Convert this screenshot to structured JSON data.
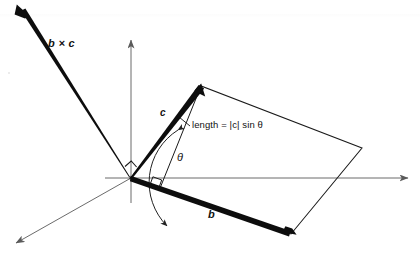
{
  "figure": {
    "width": 420,
    "height": 261,
    "background_color": "#ffffff",
    "stroke_color": "#111111",
    "axis_color": "#5a5a5a"
  },
  "labels": {
    "cross_product": "b × c",
    "vector_c": "c",
    "vector_b": "b",
    "theta": "θ",
    "length_annotation": "length = |c| sin θ"
  },
  "geometry": {
    "origin": {
      "x": 131,
      "y": 178
    },
    "vectors": [
      {
        "name": "b-cross-c",
        "label": "b × c",
        "from": {
          "x": 131,
          "y": 178
        },
        "to": {
          "x": 17,
          "y": 5
        },
        "style": "thick-arrow"
      },
      {
        "name": "c",
        "label": "c",
        "from": {
          "x": 131,
          "y": 178
        },
        "to": {
          "x": 201,
          "y": 86
        },
        "style": "thick-arrow"
      },
      {
        "name": "b",
        "label": "b",
        "from": {
          "x": 131,
          "y": 178
        },
        "to": {
          "x": 291,
          "y": 234
        },
        "style": "thick-arrow"
      }
    ],
    "axes": [
      {
        "name": "x-axis",
        "from": {
          "x": 105,
          "y": 178
        },
        "to": {
          "x": 412,
          "y": 178
        },
        "arrow": "end"
      },
      {
        "name": "y-axis",
        "from": {
          "x": 131,
          "y": 203
        },
        "to": {
          "x": 131,
          "y": 36
        },
        "arrow": "end"
      },
      {
        "name": "z-axis",
        "from": {
          "x": 131,
          "y": 178
        },
        "to": {
          "x": 12,
          "y": 245
        },
        "arrow": "end"
      }
    ],
    "parallelogram": {
      "name": "area-parallelogram",
      "points": [
        {
          "x": 131,
          "y": 178
        },
        {
          "x": 201,
          "y": 86
        },
        {
          "x": 362,
          "y": 148
        },
        {
          "x": 291,
          "y": 234
        }
      ]
    },
    "angle_arc": {
      "name": "theta-arc",
      "center": {
        "x": 131,
        "y": 178
      },
      "radius": 62,
      "from_deg": -19,
      "to_deg": -52.7,
      "arrows": "both"
    },
    "right_angle_origin": {
      "name": "right-angle-origin",
      "x": 131,
      "y": 178,
      "size": 9
    },
    "right_angle_foot": {
      "name": "right-angle-foot",
      "x": 162,
      "y": 189,
      "size": 9
    },
    "height_line": {
      "name": "perpendicular-height",
      "from": {
        "x": 201,
        "y": 86
      },
      "to": {
        "x": 160,
        "y": 188
      }
    },
    "leader_line": {
      "name": "annotation-leader",
      "from": {
        "x": 189,
        "y": 125
      },
      "to": {
        "x": 178,
        "y": 117
      }
    }
  }
}
